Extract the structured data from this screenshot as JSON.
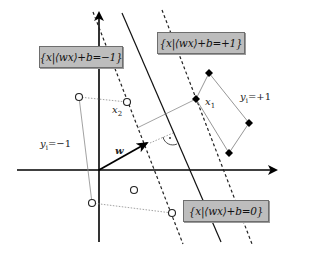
{
  "diagram": {
    "type": "svm-maximum-margin-hyperplane",
    "hyperplanes": [
      {
        "id": "minus",
        "label": "{x|⟨wx⟩+b=−1}",
        "style": "dashed",
        "line": [
          [
            93,
            12
          ],
          [
            183,
            244
          ]
        ]
      },
      {
        "id": "zero",
        "label": "{x|⟨wx⟩+b=0}",
        "style": "solid",
        "line": [
          [
            122,
            13
          ],
          [
            221,
            242
          ]
        ]
      },
      {
        "id": "plus",
        "label": "{x|⟨wx⟩+b=+1}",
        "style": "dashed",
        "line": [
          [
            162,
            10
          ],
          [
            252,
            244
          ]
        ]
      }
    ],
    "labels": {
      "box_minus": "{x|⟨wx⟩+b=−1}",
      "box_plus": "{x|⟨wx⟩+b=+1}",
      "box_zero": "{x|⟨wx⟩+b=0}",
      "x1": "x",
      "x1_sub": "1",
      "x2": "x",
      "x2_sub": "2",
      "w": "w",
      "y_plus": "y",
      "y_plus_sub": "i",
      "y_plus_val": "=+1",
      "y_minus": "y",
      "y_minus_sub": "i",
      "y_minus_val": "=−1"
    },
    "classes": {
      "negative": {
        "label": "y_i=−1",
        "marker": "open-circle",
        "points": [
          [
            79,
            97
          ],
          [
            127,
            102
          ],
          [
            134,
            190
          ],
          [
            92,
            203
          ],
          [
            172,
            213
          ]
        ]
      },
      "positive": {
        "label": "y_i=+1",
        "marker": "filled-diamond",
        "points": [
          [
            209,
            73
          ],
          [
            196,
            99
          ],
          [
            249,
            123
          ],
          [
            229,
            153
          ]
        ]
      }
    },
    "support_vectors": {
      "x1": [
        196,
        99
      ],
      "x2": [
        127,
        102
      ]
    },
    "axes": {
      "origin": [
        99,
        170
      ],
      "x_end": 277,
      "y_end": 12
    },
    "weight_vector": {
      "from": [
        99,
        170
      ],
      "to": [
        147,
        143
      ]
    },
    "colors": {
      "box_fill": "#bdbdbd",
      "box_border": "#6e6e6e",
      "axis": "#000000",
      "hull": "#8a8a8a"
    }
  }
}
